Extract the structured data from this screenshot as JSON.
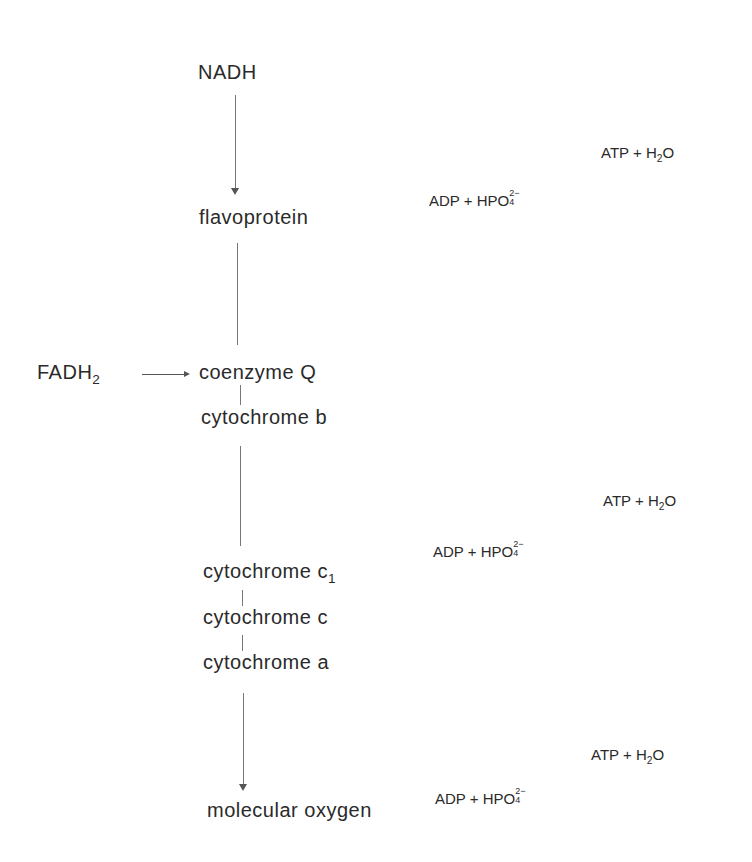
{
  "diagram": {
    "carriers": {
      "nadh": "NADH",
      "flavoprotein": "flavoprotein",
      "fadh2_base": "FADH",
      "fadh2_sub": "2",
      "coenzyme_q": "coenzyme Q",
      "cytochrome_b": "cytochrome b",
      "cytochrome_c1_base": "cytochrome c",
      "cytochrome_c1_sub": "1",
      "cytochrome_c": "cytochrome c",
      "cytochrome_a": "cytochrome a",
      "molecular_oxygen": "molecular oxygen"
    },
    "phosphorylation_sites": [
      {
        "product": {
          "atp": "ATP + H",
          "sub": "2",
          "tail": "O"
        },
        "substrate": {
          "adp": "ADP + HPO",
          "sup": "2−",
          "sub": "4"
        }
      },
      {
        "product": {
          "atp": "ATP + H",
          "sub": "2",
          "tail": "O"
        },
        "substrate": {
          "adp": "ADP + HPO",
          "sup": "2−",
          "sub": "4"
        }
      },
      {
        "product": {
          "atp": "ATP + H",
          "sub": "2",
          "tail": "O"
        },
        "substrate": {
          "adp": "ADP + HPO",
          "sup": "2−",
          "sub": "4"
        }
      }
    ]
  }
}
